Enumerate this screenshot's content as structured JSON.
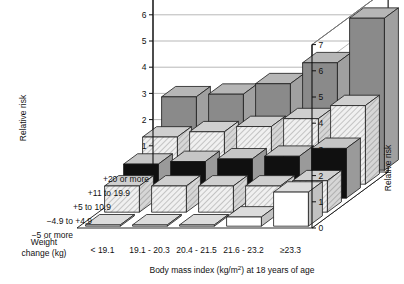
{
  "chart_data": {
    "type": "bar",
    "variant": "3d-grouped-bar",
    "title": "",
    "xlabel": "Body mass index (kg/m2) at 18 years of age",
    "xlabel_display": "Body mass index (kg/m²) at 18 years of age",
    "ylabel": "Weight change (kg)",
    "zlabel": "Relative risk",
    "zlabel_right": "Relative risk",
    "zlim": [
      0,
      7
    ],
    "zticks": [
      0,
      1,
      2,
      3,
      4,
      5,
      6,
      7
    ],
    "grid": true,
    "legend": "none",
    "categories": [
      "< 19.1",
      "19.1 - 20.3",
      "20.4 - 21.5",
      "21.6 - 23.2",
      "≥23.3"
    ],
    "rows": [
      "+20 or more",
      "+11 to 19.9",
      "+5 to 10.9",
      "−4.9 to +4.9",
      "−5 or more"
    ],
    "series": [
      {
        "name": "+20 or more",
        "fill": "solid-dark",
        "values": [
          2.8,
          2.9,
          3.3,
          4.1,
          5.8
        ]
      },
      {
        "name": "+11 to 19.9",
        "fill": "hatch",
        "values": [
          1.8,
          2.0,
          2.2,
          2.5,
          3.0
        ]
      },
      {
        "name": "+5 to 10.9",
        "fill": "solid-black",
        "values": [
          1.3,
          1.4,
          1.5,
          1.6,
          1.9
        ]
      },
      {
        "name": "−4.9 to +4.9",
        "fill": "hatch",
        "values": [
          1.0,
          1.0,
          1.0,
          1.0,
          1.2
        ]
      },
      {
        "name": "−5 or more",
        "fill": "white",
        "values": [
          0.05,
          0.05,
          0.05,
          0.35,
          1.3
        ]
      }
    ],
    "colors": {
      "solid-dark": "#8a8a8a",
      "solid-dark-top": "#b6b6b6",
      "solid-dark-side": "#a0a0a0",
      "hatch": "#e9e9e9",
      "hatch-top": "#cfcfcf",
      "hatch-side": "#bdbdbd",
      "solid-black": "#101010",
      "black-top": "#c6c6c6",
      "black-side": "#9a9a9a",
      "white": "#ffffff",
      "white-top": "#dcdcdc",
      "white-side": "#c2c2c2",
      "outline": "#1a1a1a",
      "grid": "#9a9a9a",
      "axis": "#111111",
      "background": "#ffffff"
    }
  }
}
